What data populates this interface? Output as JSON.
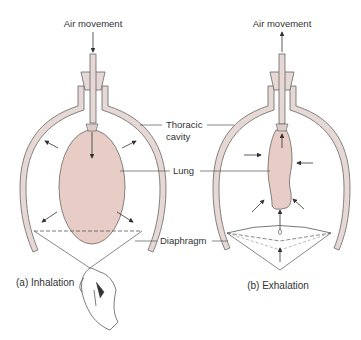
{
  "panels": [
    {
      "id": "a",
      "caption": "(a) Inhalation",
      "top_label": "Air movement",
      "air_direction": "in"
    },
    {
      "id": "b",
      "caption": "(b) Exhalation",
      "top_label": "Air movement",
      "air_direction": "out"
    }
  ],
  "labels": {
    "thoracic_line1": "Thoracic",
    "thoracic_line2": "cavity",
    "lung": "Lung",
    "diaphragm": "Diaphragm"
  },
  "colors": {
    "lung_fill": "#e8cdc7",
    "jar_fill": "#e6d8d4",
    "stroke": "#555555"
  }
}
